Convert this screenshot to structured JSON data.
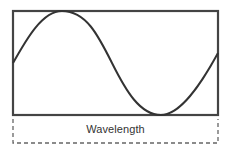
{
  "diagram": {
    "label": "Wavelength",
    "colors": {
      "frame": "#444444",
      "wave": "#333333",
      "dashed": "#666666",
      "text": "#333333"
    },
    "frame": {
      "left": 13,
      "top": 11,
      "right": 218,
      "bottom": 115
    },
    "wave": {
      "shape": "sine",
      "cycles": 1,
      "start": {
        "x": 13,
        "y": 63
      },
      "peak": {
        "x": 62,
        "y": 11
      },
      "trough": {
        "x": 161,
        "y": 115
      },
      "end": {
        "x": 218,
        "y": 53
      }
    },
    "wavelength_bracket": {
      "style": "dashed",
      "left": 13,
      "right": 218,
      "top": 118,
      "bottom": 143
    }
  }
}
